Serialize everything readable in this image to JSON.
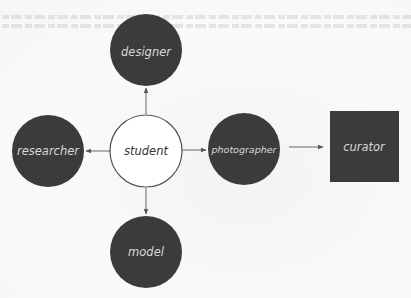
{
  "diagram": {
    "colors": {
      "dark_fill": "#3b3b3b",
      "light_fill": "#ffffff",
      "outline": "#555555",
      "edge": "#666666",
      "dark_text": "#d8d8d8",
      "light_text": "#333333"
    },
    "nodes": {
      "student": {
        "label": "student",
        "shape": "circle",
        "style": "outlined"
      },
      "designer": {
        "label": "designer",
        "shape": "circle",
        "style": "filled"
      },
      "researcher": {
        "label": "researcher",
        "shape": "circle",
        "style": "filled"
      },
      "photographer": {
        "label": "photographer",
        "shape": "circle",
        "style": "filled"
      },
      "model": {
        "label": "model",
        "shape": "circle",
        "style": "filled"
      },
      "curator": {
        "label": "curator",
        "shape": "square",
        "style": "filled"
      }
    },
    "edges": [
      {
        "from": "student",
        "to": "designer"
      },
      {
        "from": "student",
        "to": "researcher"
      },
      {
        "from": "student",
        "to": "photographer"
      },
      {
        "from": "student",
        "to": "model"
      },
      {
        "from": "photographer",
        "to": "curator"
      }
    ]
  }
}
